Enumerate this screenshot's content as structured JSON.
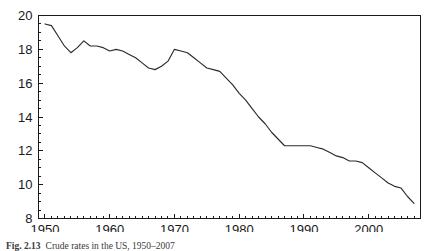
{
  "figure": {
    "caption_label": "Fig. 2.13",
    "caption_text": "Crude rates in the US, 1950–2007"
  },
  "chart_data": {
    "type": "line",
    "title": "",
    "subtitle": "",
    "xlabel": "",
    "ylabel": "",
    "xlim": [
      1949,
      2008
    ],
    "ylim": [
      8,
      20
    ],
    "grid": false,
    "legend": false,
    "legend_position": "none",
    "line_color": "#2b2b2b",
    "frame_color": "#1a1a1a",
    "background_color": "#ffffff",
    "y_ticks": [
      8,
      10,
      12,
      14,
      16,
      18,
      20
    ],
    "y_tick_labels": [
      "8",
      "10",
      "12",
      "14",
      "16",
      "18",
      "20"
    ],
    "y_minor_tick_step": 0.5,
    "x_ticks": [
      1950,
      1960,
      1970,
      1980,
      1990,
      2000
    ],
    "x_tick_labels": [
      "1950",
      "1960",
      "1970",
      "1980",
      "1990",
      "2000"
    ],
    "x_minor_tick_step": 1,
    "series": [
      {
        "name": "Crude rate",
        "x": [
          1950,
          1951,
          1952,
          1953,
          1954,
          1955,
          1956,
          1957,
          1958,
          1959,
          1960,
          1961,
          1962,
          1963,
          1964,
          1965,
          1966,
          1967,
          1968,
          1969,
          1970,
          1971,
          1972,
          1973,
          1974,
          1975,
          1976,
          1977,
          1978,
          1979,
          1980,
          1981,
          1982,
          1983,
          1984,
          1985,
          1986,
          1987,
          1988,
          1989,
          1990,
          1991,
          1992,
          1993,
          1994,
          1995,
          1996,
          1997,
          1998,
          1999,
          2000,
          2001,
          2002,
          2003,
          2004,
          2005,
          2006,
          2007
        ],
        "values": [
          19.5,
          19.4,
          18.8,
          18.2,
          17.8,
          18.1,
          18.5,
          18.2,
          18.2,
          18.1,
          17.9,
          18.0,
          17.9,
          17.7,
          17.5,
          17.2,
          16.9,
          16.8,
          17.0,
          17.3,
          18.0,
          17.9,
          17.8,
          17.5,
          17.2,
          16.9,
          16.8,
          16.7,
          16.3,
          15.9,
          15.4,
          15.0,
          14.5,
          14.0,
          13.6,
          13.1,
          12.7,
          12.3,
          12.3,
          12.3,
          12.3,
          12.3,
          12.2,
          12.1,
          11.9,
          11.7,
          11.6,
          11.4,
          11.4,
          11.3,
          11.0,
          10.7,
          10.4,
          10.1,
          9.9,
          9.8,
          9.3,
          8.9
        ]
      }
    ]
  }
}
